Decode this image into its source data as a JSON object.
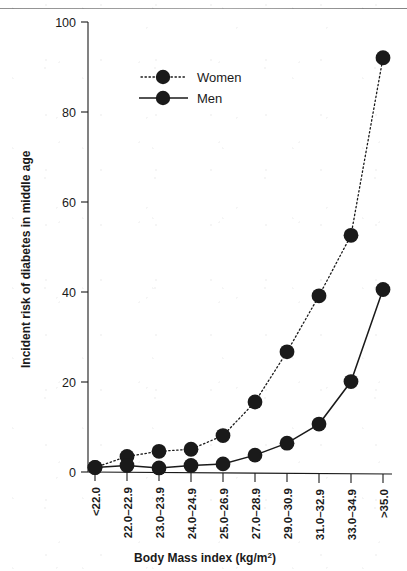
{
  "chart_data": {
    "type": "line",
    "title": "",
    "xlabel": "Body Mass index (kg/m²)",
    "xlabel_base": "Body Mass index (kg/m",
    "xlabel_sup": "2",
    "xlabel_close": ")",
    "ylabel": "Incident risk of diabetes in middle age",
    "categories": [
      "<22.0",
      "22.0–22.9",
      "23.0–23.9",
      "24.0–24.9",
      "25.0–26.9",
      "27.0–28.9",
      "29.0–30.9",
      "31.0–32.9",
      "33.0–34.9",
      ">35.0"
    ],
    "ylim": [
      0,
      100
    ],
    "yticks": [
      0,
      20,
      40,
      60,
      80,
      100
    ],
    "ytick_labels": [
      "0",
      "20",
      "40",
      "60",
      "80",
      "100"
    ],
    "grid": false,
    "legend_position": "upper-left-inside",
    "series": [
      {
        "name": "Women",
        "marker": "filled-circle",
        "linestyle": "dotted",
        "color": "#1a1a1a",
        "values": [
          1.0,
          3.5,
          4.7,
          5.2,
          8.3,
          15.8,
          27.0,
          39.5,
          53.0,
          92.5
        ]
      },
      {
        "name": "Men",
        "marker": "filled-circle",
        "linestyle": "solid",
        "color": "#1a1a1a",
        "values": [
          1.0,
          1.5,
          1.0,
          1.6,
          2.0,
          4.0,
          6.7,
          11.0,
          20.5,
          41.0
        ]
      }
    ]
  },
  "legend": {
    "items": [
      {
        "label": "Women",
        "style": "dotted"
      },
      {
        "label": "Men",
        "style": "solid"
      }
    ]
  },
  "axes": {
    "y_title": "Incident risk of diabetes in middle age",
    "x_title_base": "Body Mass index (kg/m",
    "x_title_sup": "2",
    "x_title_close": ")"
  }
}
